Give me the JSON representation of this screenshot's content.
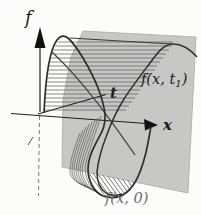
{
  "figure": {
    "name": "traveling-wave-3d-diagram",
    "labels": {
      "f_axis": "f",
      "x_axis": "x",
      "t_axis": "t",
      "wave_t1_pre": "f(x, t",
      "wave_t1_sub": "1",
      "wave_t1_post": ")",
      "wave_t0": "f(x, 0)"
    },
    "colors": {
      "background": "#fcfcfa",
      "plane_fill": "#c7c7c5",
      "plane_edge": "#a8a8a6",
      "curve": "#2e2e2c",
      "axis": "#1e1e1c",
      "hatch": "#4a4a48",
      "fan_line": "#5a5a58",
      "label_dark": "#1c1c1a",
      "label_muted": "#6e6e6c"
    }
  }
}
